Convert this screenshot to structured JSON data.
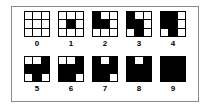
{
  "figure": {
    "colors": {
      "filled": "#000000",
      "empty": "#ffffff",
      "frame": "#8a8a8a",
      "background": "#ffffff"
    },
    "grid_size": "3x3",
    "rows": [
      {
        "cells": [
          {
            "label": "0",
            "pattern": [
              [
                0,
                0,
                0
              ],
              [
                0,
                0,
                0
              ],
              [
                0,
                0,
                0
              ]
            ]
          },
          {
            "label": "1",
            "pattern": [
              [
                0,
                0,
                0
              ],
              [
                0,
                1,
                0
              ],
              [
                0,
                0,
                0
              ]
            ]
          },
          {
            "label": "2",
            "pattern": [
              [
                1,
                0,
                0
              ],
              [
                1,
                1,
                0
              ],
              [
                0,
                0,
                0
              ]
            ]
          },
          {
            "label": "3",
            "pattern": [
              [
                1,
                0,
                0
              ],
              [
                1,
                1,
                0
              ],
              [
                0,
                1,
                0
              ]
            ]
          },
          {
            "label": "4",
            "pattern": [
              [
                1,
                1,
                0
              ],
              [
                1,
                1,
                0
              ],
              [
                0,
                1,
                0
              ]
            ]
          }
        ]
      },
      {
        "cells": [
          {
            "label": "5",
            "pattern": [
              [
                0,
                0,
                1
              ],
              [
                1,
                1,
                1
              ],
              [
                0,
                1,
                0
              ]
            ]
          },
          {
            "label": "6",
            "pattern": [
              [
                0,
                0,
                1
              ],
              [
                1,
                1,
                1
              ],
              [
                1,
                1,
                0
              ]
            ]
          },
          {
            "label": "7",
            "pattern": [
              [
                1,
                0,
                1
              ],
              [
                1,
                1,
                1
              ],
              [
                1,
                1,
                0
              ]
            ]
          },
          {
            "label": "8",
            "pattern": [
              [
                1,
                0,
                1
              ],
              [
                1,
                1,
                1
              ],
              [
                1,
                1,
                1
              ]
            ]
          },
          {
            "label": "9",
            "pattern": [
              [
                1,
                1,
                1
              ],
              [
                1,
                1,
                1
              ],
              [
                1,
                1,
                1
              ]
            ]
          }
        ]
      }
    ]
  }
}
